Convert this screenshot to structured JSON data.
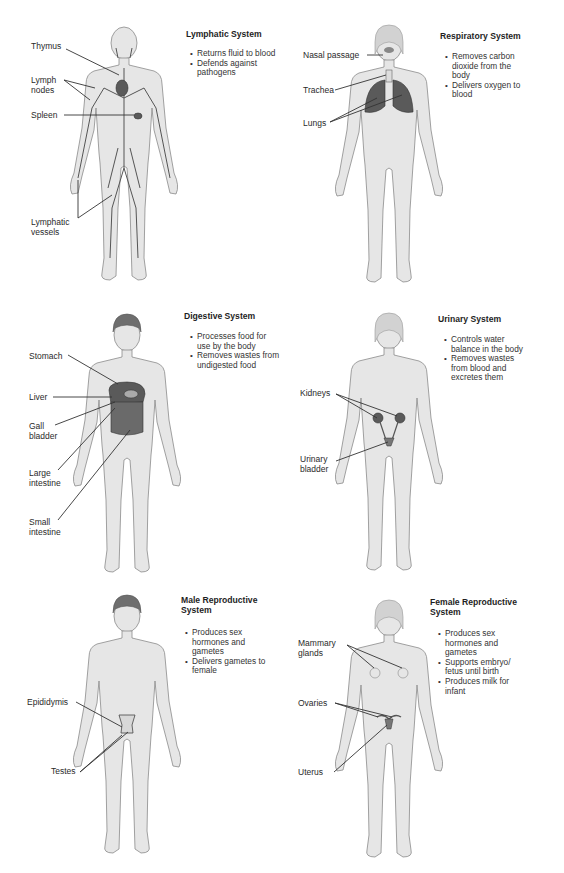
{
  "panels": [
    {
      "id": "lymphatic",
      "title": "Lymphatic System",
      "functions": [
        "Returns fluid to blood",
        "Defends against pathogens"
      ],
      "labels": [
        "Thymus",
        "Lymph\nnodes",
        "Spleen",
        "Lymphatic\nvessels"
      ],
      "figure": "male"
    },
    {
      "id": "respiratory",
      "title": "Respiratory System",
      "functions": [
        "Removes carbon dioxide from the body",
        "Delivers oxygen to blood"
      ],
      "labels": [
        "Nasal passage",
        "Trachea",
        "Lungs"
      ],
      "figure": "female"
    },
    {
      "id": "digestive",
      "title": "Digestive System",
      "functions": [
        "Processes food for use by the body",
        "Removes wastes from undigested food"
      ],
      "labels": [
        "Stomach",
        "Liver",
        "Gall\nbladder",
        "Large\nintestine",
        "Small\nintestine"
      ],
      "figure": "male"
    },
    {
      "id": "urinary",
      "title": "Urinary System",
      "functions": [
        "Controls water balance in the body",
        "Removes wastes from blood and excretes them"
      ],
      "labels": [
        "Kidneys",
        "Urinary\nbladder"
      ],
      "figure": "female"
    },
    {
      "id": "male-reproductive",
      "title": "Male Reproductive\nSystem",
      "functions": [
        "Produces sex hormones and gametes",
        "Delivers gametes to female"
      ],
      "labels": [
        "Epididymis",
        "Testes"
      ],
      "figure": "male"
    },
    {
      "id": "female-reproductive",
      "title": "Female Reproductive\nSystem",
      "functions": [
        "Produces sex hormones and gametes",
        "Supports embryo/ fetus until birth",
        "Produces milk for infant"
      ],
      "labels": [
        "Mammary\nglands",
        "Ovaries",
        "Uterus"
      ],
      "figure": "female"
    }
  ]
}
